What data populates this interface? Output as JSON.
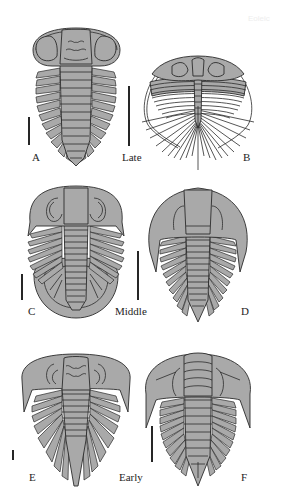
{
  "figure": {
    "watermark": "Eoleic",
    "colors": {
      "fill": "#a9a9a9",
      "stroke": "#2b2b2b",
      "background": "#ffffff"
    },
    "panels": [
      {
        "letter": "A",
        "period": "Late",
        "row": 0,
        "col": 0
      },
      {
        "letter": "B",
        "period": "Late",
        "row": 0,
        "col": 1
      },
      {
        "letter": "C",
        "period": "Middle",
        "row": 1,
        "col": 0
      },
      {
        "letter": "D",
        "period": "Middle",
        "row": 1,
        "col": 1
      },
      {
        "letter": "E",
        "period": "Early",
        "row": 2,
        "col": 0
      },
      {
        "letter": "F",
        "period": "Early",
        "row": 2,
        "col": 1
      }
    ],
    "period_labels": [
      "Late",
      "Middle",
      "Early"
    ]
  }
}
